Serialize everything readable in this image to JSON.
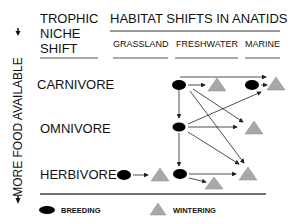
{
  "header": {
    "trophic_line1": "TROPHIC",
    "trophic_line2": "NICHE",
    "trophic_line3": "SHIFT",
    "habitat_title": "HABITAT SHIFTS IN ANATIDS"
  },
  "columns": [
    "GRASSLAND",
    "FRESHWATER",
    "MARINE"
  ],
  "rows": [
    "CARNIVORE",
    "OMNIVORE",
    "HERBIVORE"
  ],
  "axis_label": "MORE FOOD AVAILABLE",
  "legend": {
    "breeding": "BREEDING",
    "wintering": "WINTERING"
  },
  "colors": {
    "breeding": "#000000",
    "wintering": "#a8a8a8",
    "line": "#222222"
  }
}
